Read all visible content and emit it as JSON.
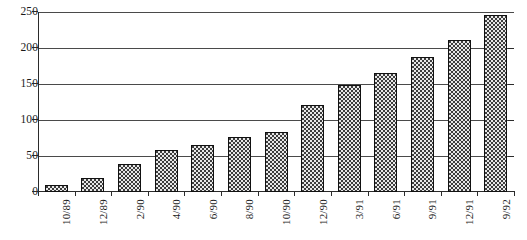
{
  "chart_data": {
    "type": "bar",
    "title": "",
    "subtitle": "",
    "xlabel": "",
    "ylabel": "",
    "categories": [
      "10/89",
      "12/89",
      "2/90",
      "4/90",
      "6/90",
      "8/90",
      "10/90",
      "12/90",
      "3/91",
      "6/91",
      "9/91",
      "12/91",
      "9/92"
    ],
    "values": [
      10,
      20,
      39,
      59,
      65,
      77,
      84,
      122,
      150,
      166,
      188,
      213,
      247
    ],
    "ylim": [
      0,
      250
    ],
    "ytick_labels": [
      "0",
      "50",
      "100",
      "150",
      "200",
      "250"
    ],
    "ytick_values": [
      0,
      50,
      100,
      150,
      200,
      250
    ],
    "grid": true,
    "grid_axis": "y",
    "legend": "none",
    "legend_position": "none",
    "bar_fill": "checkerboard",
    "bar_fill_color": "#3d3d3d",
    "bar_fill_highlight": "#e8e8e8",
    "bar_border_color": "#111111",
    "axis_color": "#2b2b2b",
    "grid_color": "#4a4a4a",
    "background": "#ffffff",
    "xlabel_rotation": -90,
    "annotations": []
  },
  "caption": {
    "remnant": ""
  }
}
